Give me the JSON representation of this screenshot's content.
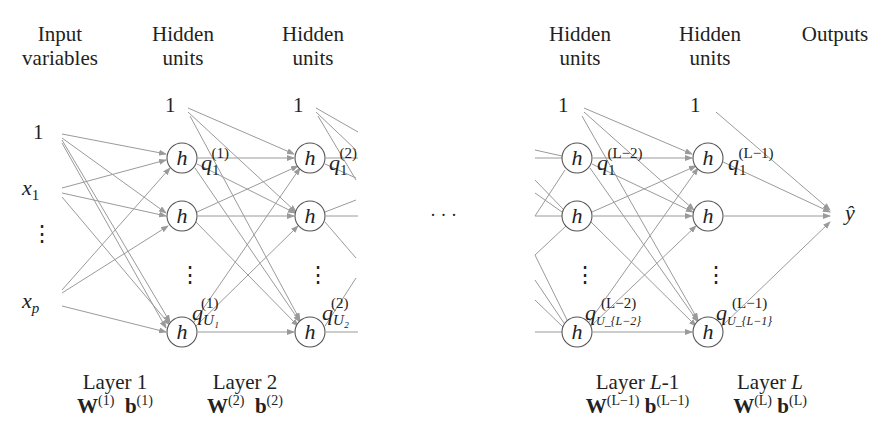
{
  "title_fragment": "p    g",
  "headers": [
    {
      "line1": "Input",
      "line2": "variables"
    },
    {
      "line1": "Hidden",
      "line2": "units"
    },
    {
      "line1": "Hidden",
      "line2": "units"
    },
    {
      "line1": "Hidden",
      "line2": "units"
    },
    {
      "line1": "Hidden",
      "line2": "units"
    },
    {
      "line1": "Outputs",
      "line2": ""
    }
  ],
  "bias_label": "1",
  "inputs": {
    "x1": "x",
    "x1_sub": "1",
    "dots": "⋮",
    "xp": "x",
    "xp_sub": "p"
  },
  "node_label": "h",
  "ellipsis": "· · ·",
  "output_label": "ŷ",
  "q_labels": [
    {
      "base": "q",
      "sup": "(1)",
      "sub": "1"
    },
    {
      "base": "q",
      "sup": "(1)",
      "sub": "U₁"
    },
    {
      "base": "q",
      "sup": "(2)",
      "sub": "1"
    },
    {
      "base": "q",
      "sup": "(2)",
      "sub": "U₂"
    },
    {
      "base": "q",
      "sup": "(L−2)",
      "sub": "1"
    },
    {
      "base": "q",
      "sup": "(L−2)",
      "sub": "U_{L−2}"
    },
    {
      "base": "q",
      "sup": "(L−1)",
      "sub": "1"
    },
    {
      "base": "q",
      "sup": "(L−1)",
      "sub": "U_{L−1}"
    }
  ],
  "layers": [
    {
      "name": "Layer 1",
      "W": "W",
      "W_sup": "(1)",
      "b": "b",
      "b_sup": "(1)"
    },
    {
      "name": "Layer 2",
      "W": "W",
      "W_sup": "(2)",
      "b": "b",
      "b_sup": "(2)"
    },
    {
      "name_pre": "Layer ",
      "name_it": "L",
      "name_post": "-1",
      "W": "W",
      "W_sup": "(L−1)",
      "b": "b",
      "b_sup": "(L−1)"
    },
    {
      "name_pre": "Layer ",
      "name_it": "L",
      "name_post": "",
      "W": "W",
      "W_sup": "(L)",
      "b": "b",
      "b_sup": "(L)"
    }
  ],
  "colors": {
    "edge": "#9a9a9a",
    "node_stroke": "#555555",
    "text": "#222222"
  }
}
